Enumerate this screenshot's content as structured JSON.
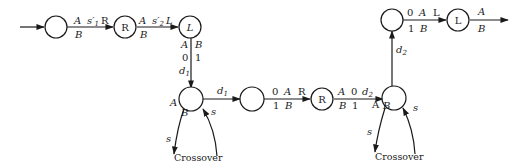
{
  "diagram": {
    "type": "state-transition",
    "nodes": [
      {
        "id": "n1",
        "label": ""
      },
      {
        "id": "n2",
        "label": "R"
      },
      {
        "id": "n3",
        "label": "L"
      },
      {
        "id": "n4",
        "label": ""
      },
      {
        "id": "n5",
        "label": ""
      },
      {
        "id": "n6",
        "label": "R"
      },
      {
        "id": "n7",
        "label": ""
      },
      {
        "id": "n8",
        "label": ""
      },
      {
        "id": "n9",
        "label": "L"
      }
    ],
    "edges": {
      "e12": {
        "top_a": "A",
        "top_b": "s′",
        "top_b_sub": "1",
        "top_c": "R",
        "bottom": "B"
      },
      "e23": {
        "top_a": "A",
        "top_b": "s′",
        "top_b_sub": "2",
        "top_c": "L",
        "bottom": "B"
      },
      "e34": {
        "left_top": "A",
        "right_top": "B",
        "left_mid": "0",
        "right_mid": "1",
        "arrow": "d",
        "arrow_sub": "1"
      },
      "e45": {
        "label": "d",
        "label_sub": "1"
      },
      "e56": {
        "top_a": "0",
        "top_b": "A",
        "top_c": "R",
        "bottom_a": "1",
        "bottom_b": "B"
      },
      "e67": {
        "top_a": "A",
        "top_b": "0",
        "top_c": "d",
        "top_c_sub": "2",
        "bottom_a": "B",
        "bottom_b": "1"
      },
      "e78": {
        "label": "d",
        "label_sub": "2"
      },
      "e89": {
        "top_a": "0",
        "top_b": "A",
        "top_c": "L",
        "bottom_a": "1",
        "bottom_b": "B"
      },
      "e9out": {
        "top": "A",
        "bottom": "B"
      },
      "loop4": {
        "left_top": "A",
        "left_bottom": "B",
        "out": "s",
        "in": "s",
        "caption": "Crossover"
      },
      "loop7": {
        "left_top": "A",
        "left_bottom": "B",
        "out": "s",
        "in": "s",
        "caption": "Crossover"
      }
    }
  }
}
